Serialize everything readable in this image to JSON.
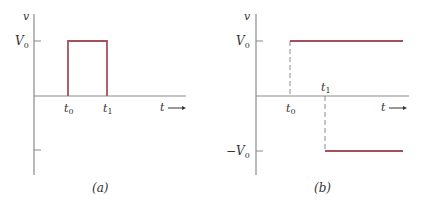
{
  "colors": {
    "axis": "#8a8a8a",
    "signal": "#a8505a",
    "text": "#333333"
  },
  "panel_a": {
    "caption": "(a)",
    "y_axis_label": "v",
    "x_axis_label": "t",
    "y_tick_label": "V",
    "y_tick_sub": "0",
    "t0_label": "t",
    "t0_sub": "0",
    "t1_label": "t",
    "t1_sub": "1",
    "arrow": "⟶",
    "description": "Rectangular pulse of height V0 from t0 to t1"
  },
  "panel_b": {
    "caption": "(b)",
    "y_axis_label": "v",
    "x_axis_label": "t",
    "pos_tick_label": "V",
    "pos_tick_sub": "0",
    "neg_tick_label": "−V",
    "neg_tick_sub": "0",
    "t0_label": "t",
    "t0_sub": "0",
    "t1_label": "t",
    "t1_sub": "1",
    "arrow": "⟶",
    "description": "Positive step V0 starting at t0 and negative step −V0 starting at t1"
  }
}
